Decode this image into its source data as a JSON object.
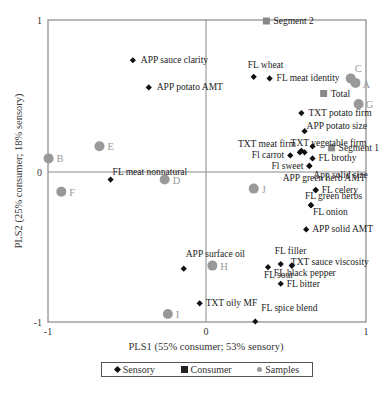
{
  "chart_data": {
    "type": "scatter",
    "title": "",
    "xlabel": "PLS1 (55% consumer; 53% sensory)",
    "ylabel": "PLS2 (25% consumer; 18% sensory)",
    "xlim": [
      -1,
      1
    ],
    "ylim": [
      -1,
      1
    ],
    "x_ticks": [
      "-1",
      "0",
      "1"
    ],
    "y_ticks": [
      "1",
      "0",
      "-1"
    ],
    "grid": false,
    "zero_lines": true,
    "legend_position": "bottom",
    "legend": [
      "Sensory",
      "Consumer",
      "Samples"
    ],
    "series": [
      {
        "name": "Sensory",
        "marker": "diamond",
        "color": "#111111",
        "points": [
          {
            "label": "APP sauce clarity",
            "x": -0.46,
            "y": 0.74
          },
          {
            "label": "APP potato AMT",
            "x": -0.36,
            "y": 0.56
          },
          {
            "label": "FL wheat",
            "x": 0.3,
            "y": 0.63
          },
          {
            "label": "FL meat identity",
            "x": 0.4,
            "y": 0.62
          },
          {
            "label": "TXT potato firm",
            "x": 0.6,
            "y": 0.39
          },
          {
            "label": "APP potato size",
            "x": 0.62,
            "y": 0.27
          },
          {
            "label": "TXT meat firm",
            "x": 0.59,
            "y": 0.13
          },
          {
            "label": "TXT vegetable firm",
            "x": 0.62,
            "y": 0.13
          },
          {
            "label": "",
            "x": 0.6,
            "y": 0.14
          },
          {
            "label": "Fl carrot",
            "x": 0.53,
            "y": 0.11
          },
          {
            "label": "",
            "x": 0.67,
            "y": 0.17
          },
          {
            "label": "FL brothy",
            "x": 0.67,
            "y": 0.09
          },
          {
            "label": "Fl sweet",
            "x": 0.65,
            "y": 0.04
          },
          {
            "label": "App solid size",
            "x": 0.65,
            "y": 0.04
          },
          {
            "label": "FL meat nonnatural",
            "x": -0.6,
            "y": -0.05
          },
          {
            "label": "APP green herb AMT",
            "x": 0.69,
            "y": -0.12
          },
          {
            "label": "FL celery",
            "x": 0.69,
            "y": -0.12
          },
          {
            "label": "FL green herbs",
            "x": 0.66,
            "y": -0.22
          },
          {
            "label": "FL onion",
            "x": 0.66,
            "y": -0.22
          },
          {
            "label": "APP solid AMT",
            "x": 0.63,
            "y": -0.38
          },
          {
            "label": "APP surface oil",
            "x": -0.14,
            "y": -0.64
          },
          {
            "label": "FL filler",
            "x": 0.47,
            "y": -0.61
          },
          {
            "label": "FL sour",
            "x": 0.39,
            "y": -0.63
          },
          {
            "label": "TXT sauce viscosity",
            "x": 0.54,
            "y": -0.62
          },
          {
            "label": "FL black pepper",
            "x": 0.54,
            "y": -0.62
          },
          {
            "label": "FL bitter",
            "x": 0.47,
            "y": -0.74
          },
          {
            "label": "TXT oily MF",
            "x": -0.04,
            "y": -0.87
          },
          {
            "label": "FL spice blend",
            "x": 0.31,
            "y": -0.99
          }
        ]
      },
      {
        "name": "Consumer",
        "marker": "square",
        "color": "#888888",
        "points": [
          {
            "label": "Segment 2",
            "x": 0.38,
            "y": 1.0
          },
          {
            "label": "Total",
            "x": 0.74,
            "y": 0.52
          },
          {
            "label": "Segment 1",
            "x": 0.79,
            "y": 0.16
          }
        ]
      },
      {
        "name": "Samples",
        "marker": "circle",
        "color": "#999999",
        "points": [
          {
            "label": "A",
            "x": 0.94,
            "y": 0.59
          },
          {
            "label": "C",
            "x": 0.91,
            "y": 0.62
          },
          {
            "label": "G",
            "x": 0.96,
            "y": 0.45
          },
          {
            "label": "B",
            "x": -0.99,
            "y": 0.09
          },
          {
            "label": "E",
            "x": -0.67,
            "y": 0.17
          },
          {
            "label": "F",
            "x": -0.91,
            "y": -0.13
          },
          {
            "label": "D",
            "x": -0.26,
            "y": -0.05
          },
          {
            "label": "J",
            "x": 0.3,
            "y": -0.11
          },
          {
            "label": "H",
            "x": 0.04,
            "y": -0.62
          },
          {
            "label": "I",
            "x": -0.24,
            "y": -0.94
          }
        ]
      }
    ]
  },
  "labels": {
    "sensory": [
      {
        "text": "APP sauce clarity",
        "dx": 8,
        "dy": 3,
        "anchor": "start"
      },
      {
        "text": "APP potato AMT",
        "dx": 8,
        "dy": 3,
        "anchor": "start"
      },
      {
        "text": "FL wheat",
        "dx": -6,
        "dy": -9,
        "anchor": "start"
      },
      {
        "text": "FL meat identity",
        "dx": 7,
        "dy": 3,
        "anchor": "start"
      },
      {
        "text": "TXT potato firm",
        "dx": 7,
        "dy": 3,
        "anchor": "start"
      },
      {
        "text": "APP potato size",
        "dx": 2,
        "dy": -2,
        "anchor": "start"
      },
      {
        "text": "TXT meat firm",
        "dx": -4,
        "dy": -5,
        "anchor": "end"
      },
      {
        "text": "TXT vegetable firm",
        "dx": -14,
        "dy": -6,
        "anchor": "start"
      },
      {
        "text": "",
        "dx": 0,
        "dy": 0,
        "anchor": "start"
      },
      {
        "text": "Fl carrot",
        "dx": -6,
        "dy": 3,
        "anchor": "end"
      },
      {
        "text": "",
        "dx": 0,
        "dy": 0,
        "anchor": "start"
      },
      {
        "text": "FL brothy",
        "dx": 6,
        "dy": 3,
        "anchor": "start"
      },
      {
        "text": "Fl sweet",
        "dx": -6,
        "dy": 3,
        "anchor": "end"
      },
      {
        "text": "App solid size",
        "dx": 4,
        "dy": 12,
        "anchor": "start"
      },
      {
        "text": "FL meat nonnatural",
        "dx": 2,
        "dy": -5,
        "anchor": "start"
      },
      {
        "text": "APP green herb AMT",
        "dx": -33,
        "dy": -9,
        "anchor": "start"
      },
      {
        "text": "FL celery",
        "dx": 6,
        "dy": 3,
        "anchor": "start"
      },
      {
        "text": "FL green herbs",
        "dx": -6,
        "dy": -6,
        "anchor": "start"
      },
      {
        "text": "FL onion",
        "dx": 2,
        "dy": 10,
        "anchor": "start"
      },
      {
        "text": "APP solid AMT",
        "dx": 6,
        "dy": 3,
        "anchor": "start"
      },
      {
        "text": "APP surface oil",
        "dx": 2,
        "dy": -12,
        "anchor": "start"
      },
      {
        "text": "FL filler",
        "dx": -6,
        "dy": -10,
        "anchor": "start"
      },
      {
        "text": "FL sour",
        "dx": -4,
        "dy": 11,
        "anchor": "start"
      },
      {
        "text": "TXT sauce viscosity",
        "dx": -1,
        "dy": -1,
        "anchor": "start"
      },
      {
        "text": "FL black pepper",
        "dx": -18,
        "dy": 10,
        "anchor": "start"
      },
      {
        "text": "FL bitter",
        "dx": 6,
        "dy": 3,
        "anchor": "start"
      },
      {
        "text": "TXT oily MF",
        "dx": 6,
        "dy": 3,
        "anchor": "start"
      },
      {
        "text": "FL spice blend",
        "dx": 6,
        "dy": -10,
        "anchor": "start"
      }
    ],
    "consumer": [
      {
        "text": "Segment 2",
        "dx": 7,
        "dy": 3,
        "anchor": "start"
      },
      {
        "text": "Total",
        "dx": 7,
        "dy": 4,
        "anchor": "start"
      },
      {
        "text": "Segment 1",
        "dx": 7,
        "dy": 3,
        "anchor": "start"
      }
    ],
    "samples": [
      {
        "text": "A",
        "dx": 7,
        "dy": 5,
        "anchor": "start"
      },
      {
        "text": "C",
        "dx": 4,
        "dy": -6,
        "anchor": "start"
      },
      {
        "text": "G",
        "dx": 7,
        "dy": 4,
        "anchor": "start"
      },
      {
        "text": "B",
        "dx": 8,
        "dy": 4,
        "anchor": "start"
      },
      {
        "text": "E",
        "dx": 8,
        "dy": 4,
        "anchor": "start"
      },
      {
        "text": "F",
        "dx": 8,
        "dy": 4,
        "anchor": "start"
      },
      {
        "text": "D",
        "dx": 8,
        "dy": 4,
        "anchor": "start"
      },
      {
        "text": "J",
        "dx": 8,
        "dy": 4,
        "anchor": "start"
      },
      {
        "text": "H",
        "dx": 8,
        "dy": 4,
        "anchor": "start"
      },
      {
        "text": "I",
        "dx": 8,
        "dy": 4,
        "anchor": "start"
      }
    ]
  },
  "legend": {
    "sensory": "Sensory",
    "consumer": "Consumer",
    "samples": "Samples"
  }
}
